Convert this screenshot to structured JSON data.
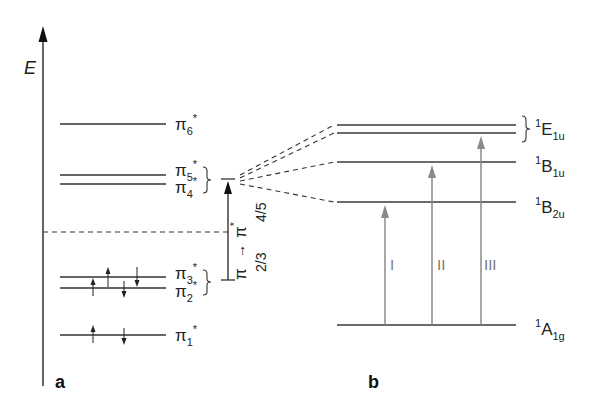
{
  "panel_a": {
    "label": "a",
    "axis_label": "E",
    "orbitals": [
      {
        "id": "pi6",
        "symbol": "π",
        "sub": "6",
        "sup": "*",
        "electrons": []
      },
      {
        "id": "pi5",
        "symbol": "π",
        "sub": "5",
        "sup": "*",
        "electrons": []
      },
      {
        "id": "pi4",
        "symbol": "π",
        "sub": "4",
        "sup": "*",
        "electrons": []
      },
      {
        "id": "pi3",
        "symbol": "π",
        "sub": "3",
        "sup": "*",
        "electrons": [
          "up",
          "down"
        ]
      },
      {
        "id": "pi2",
        "symbol": "π",
        "sub": "2",
        "sup": "*",
        "electrons": [
          "up",
          "down"
        ]
      },
      {
        "id": "pi1",
        "symbol": "π",
        "sub": "1",
        "sup": "*",
        "electrons": [
          "up",
          "down"
        ]
      }
    ],
    "transition": {
      "from_symbol": "π",
      "arrow": "→",
      "to_symbol": "π",
      "to_sup": "*",
      "from_orbitals": "2/3",
      "to_orbitals": "4/5"
    }
  },
  "panel_b": {
    "label": "b",
    "states": [
      {
        "id": "E1u",
        "sup": "1",
        "letter": "E",
        "sub": "1u"
      },
      {
        "id": "B1u",
        "sup": "1",
        "letter": "B",
        "sub": "1u"
      },
      {
        "id": "B2u",
        "sup": "1",
        "letter": "B",
        "sub": "2u"
      },
      {
        "id": "A1g",
        "sup": "1",
        "letter": "A",
        "sub": "1g"
      }
    ],
    "transitions": [
      {
        "id": "I",
        "label": "I",
        "from": "A1g",
        "to": "B2u"
      },
      {
        "id": "II",
        "label": "II",
        "from": "A1g",
        "to": "B1u"
      },
      {
        "id": "III",
        "label": "III",
        "from": "A1g",
        "to": "E1u"
      }
    ]
  },
  "colors": {
    "line": "#333333",
    "transition_arrow": "#8a8a8a",
    "background": "#ffffff"
  }
}
